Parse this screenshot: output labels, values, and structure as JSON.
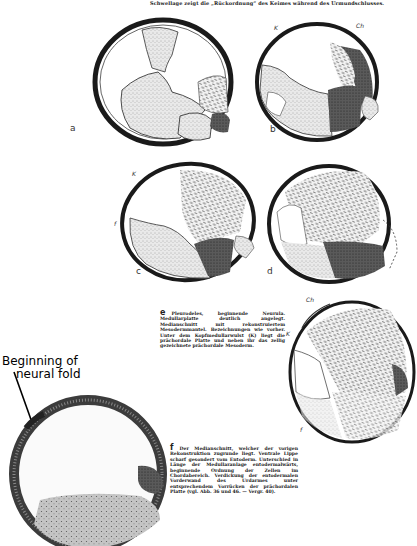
{
  "header": {
    "text": "Schwellage zeigt die „Rückordnung“ des Keimes während des Urmundschlusses."
  },
  "figures": [
    {
      "id": "a",
      "label": "a",
      "inner_marks": []
    },
    {
      "id": "b",
      "label": "b",
      "inner_marks": [
        "K",
        "Ch",
        "p",
        "f"
      ]
    },
    {
      "id": "c",
      "label": "c",
      "inner_marks": [
        "K",
        "f"
      ]
    },
    {
      "id": "d",
      "label": "d",
      "inner_marks": []
    },
    {
      "id": "e",
      "label": "",
      "inner_marks": [
        "Ch",
        "K",
        "f"
      ]
    },
    {
      "id": "f",
      "label": "",
      "inner_marks": []
    }
  ],
  "captions": {
    "e": {
      "letter": "e",
      "text": "Pleurodeles, beginnende Neurula. Medullarplatte deutlich angelegt. Medianschnitt mit rekonstruiertem Mesodermmantel. Bezeichnungen wie vorher. Unter dem Kopfmedullarwulst (K) liegt die prächordale Platte und neben ihr das zellig gezeichnete prächordale Mesoderm."
    },
    "f": {
      "letter": "f",
      "text": "Der Medianschnitt, welcher der vorigen Rekonstruktion zugrunde liegt. Ventrale Lippe scharf gesondert vom Entoderm. Unterschied in Länge der Medullaranlage entodermalwärts, beginnende Ordnung der Zellen im Chordabereich. Verdickung der entodermalen Vorderwand des Urdarmes unter entsprechendem Vorrücken der prächordalen Platte (vgl. Abb. 36 und 46. — Vergr. 40)."
    }
  },
  "annotation": {
    "line1": "Beginning of",
    "line2": "neural fold"
  },
  "colors": {
    "ink": "#1a1a1a",
    "paper": "#ffffff",
    "stipple": "#9a9a9a",
    "dark_tissue": "#3a3a3a",
    "section_fill": "#bdbdbd"
  }
}
